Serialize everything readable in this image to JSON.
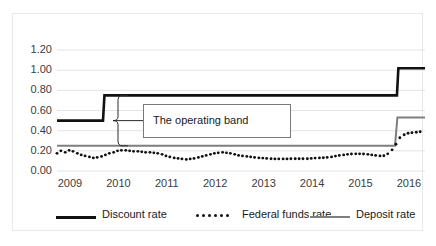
{
  "chart_data": {
    "type": "line",
    "title": "",
    "xlabel": "",
    "ylabel": "",
    "xlim": [
      2009.0,
      2016.6
    ],
    "ylim": [
      0.0,
      1.3
    ],
    "grid": true,
    "y_ticks": [
      "0.00",
      "0.20",
      "0.40",
      "0.60",
      "0.80",
      "1.00",
      "1.20"
    ],
    "y_tick_values": [
      0.0,
      0.2,
      0.4,
      0.6,
      0.8,
      1.0,
      1.2
    ],
    "x_ticks": [
      "2009",
      "2010",
      "2011",
      "2012",
      "2013",
      "2014",
      "2015",
      "2016"
    ],
    "x_tick_values": [
      2009,
      2010,
      2011,
      2012,
      2013,
      2014,
      2015,
      2016
    ],
    "legend_position": "bottom",
    "annotations": [
      {
        "name": "operating-band",
        "text": "The operating band",
        "bracket_from": 0.75,
        "bracket_to": 0.25
      }
    ],
    "series": [
      {
        "name": "Discount rate",
        "style": "solid",
        "color": "#111111",
        "width": 2.6,
        "x": [
          2009.0,
          2009.95,
          2009.98,
          2016.02,
          2016.05,
          2016.6
        ],
        "values": [
          0.5,
          0.5,
          0.75,
          0.75,
          1.02,
          1.02
        ]
      },
      {
        "name": "Deposit rate",
        "style": "solid",
        "color": "#7f7f7f",
        "width": 2.0,
        "x": [
          2009.0,
          2015.98,
          2016.03,
          2016.6
        ],
        "values": [
          0.25,
          0.25,
          0.53,
          0.53
        ]
      },
      {
        "name": "Federal funds rate",
        "style": "dotted",
        "color": "#111111",
        "width": 2.6,
        "x": [
          2009.0,
          2009.08,
          2009.17,
          2009.25,
          2009.33,
          2009.42,
          2009.5,
          2009.58,
          2009.67,
          2009.75,
          2009.83,
          2009.92,
          2010.0,
          2010.08,
          2010.17,
          2010.25,
          2010.33,
          2010.42,
          2010.5,
          2010.58,
          2010.67,
          2010.75,
          2010.83,
          2010.92,
          2011.0,
          2011.08,
          2011.17,
          2011.25,
          2011.33,
          2011.42,
          2011.5,
          2011.58,
          2011.67,
          2011.75,
          2011.83,
          2011.92,
          2012.0,
          2012.08,
          2012.17,
          2012.25,
          2012.33,
          2012.42,
          2012.5,
          2012.58,
          2012.67,
          2012.75,
          2012.83,
          2012.92,
          2013.0,
          2013.08,
          2013.17,
          2013.25,
          2013.33,
          2013.42,
          2013.5,
          2013.58,
          2013.67,
          2013.75,
          2013.83,
          2013.92,
          2014.0,
          2014.08,
          2014.17,
          2014.25,
          2014.33,
          2014.42,
          2014.5,
          2014.58,
          2014.67,
          2014.75,
          2014.83,
          2014.92,
          2015.0,
          2015.08,
          2015.17,
          2015.25,
          2015.33,
          2015.42,
          2015.5,
          2015.58,
          2015.67,
          2015.75,
          2015.83,
          2015.92,
          2016.0,
          2016.08,
          2016.17,
          2016.25,
          2016.33,
          2016.42,
          2016.5
        ],
        "values": [
          0.175,
          0.2,
          0.185,
          0.205,
          0.195,
          0.175,
          0.16,
          0.15,
          0.14,
          0.13,
          0.135,
          0.145,
          0.16,
          0.175,
          0.185,
          0.2,
          0.205,
          0.205,
          0.2,
          0.195,
          0.195,
          0.19,
          0.185,
          0.185,
          0.18,
          0.175,
          0.165,
          0.15,
          0.14,
          0.13,
          0.125,
          0.12,
          0.115,
          0.12,
          0.125,
          0.135,
          0.145,
          0.155,
          0.165,
          0.175,
          0.18,
          0.185,
          0.18,
          0.175,
          0.165,
          0.155,
          0.15,
          0.145,
          0.14,
          0.135,
          0.13,
          0.128,
          0.125,
          0.122,
          0.12,
          0.12,
          0.12,
          0.12,
          0.122,
          0.122,
          0.122,
          0.122,
          0.122,
          0.125,
          0.128,
          0.13,
          0.132,
          0.135,
          0.14,
          0.148,
          0.155,
          0.16,
          0.165,
          0.168,
          0.17,
          0.17,
          0.168,
          0.165,
          0.16,
          0.155,
          0.15,
          0.152,
          0.17,
          0.21,
          0.265,
          0.33,
          0.36,
          0.375,
          0.38,
          0.385,
          0.39
        ]
      }
    ]
  },
  "legend": {
    "items": [
      {
        "label": "Discount rate",
        "style": "solid",
        "color": "#111111"
      },
      {
        "label": "Federal funds rate",
        "style": "dotted",
        "color": "#111111"
      },
      {
        "label": "Deposit rate",
        "style": "solid",
        "color": "#7f7f7f"
      }
    ]
  },
  "annotation": {
    "operating_band_label": "The operating band"
  }
}
